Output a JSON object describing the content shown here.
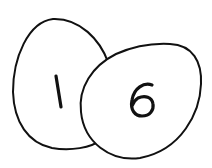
{
  "illustration": {
    "eggs": [
      {
        "label": "1",
        "position": "left-back"
      },
      {
        "label": "6",
        "position": "right-front"
      }
    ],
    "colors": {
      "stroke": "#111111",
      "fill": "#ffffff",
      "background": "#ffffff"
    }
  }
}
